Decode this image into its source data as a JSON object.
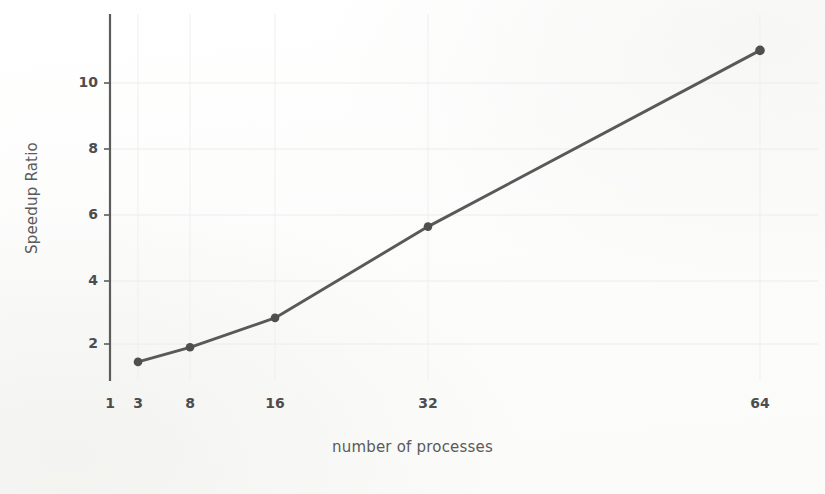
{
  "chart_data": {
    "type": "line",
    "title": "",
    "subtitle": "",
    "xlabel": "number of processes",
    "ylabel": "Speedup Ratio",
    "x": [
      3,
      8,
      16,
      32,
      64
    ],
    "values": [
      1.45,
      1.9,
      2.8,
      5.6,
      11.0
    ],
    "series": [
      {
        "name": "speedup",
        "x": [
          3,
          8,
          16,
          32,
          64
        ],
        "values": [
          1.45,
          1.9,
          2.8,
          5.6,
          11.0
        ]
      }
    ],
    "xtick_labels": [
      "1",
      "3",
      "8",
      "16",
      "32",
      "64"
    ],
    "xtick_values": [
      1,
      3,
      8,
      16,
      32,
      64
    ],
    "ytick_labels": [
      "2",
      "4",
      "6",
      "8",
      "10"
    ],
    "ytick_values": [
      2,
      4,
      6,
      8,
      10
    ],
    "xlim": [
      1,
      67
    ],
    "ylim": [
      0.55,
      11.6
    ],
    "grid": true,
    "legend": false,
    "legend_position": "none",
    "marker": "circle",
    "line_color": "#595959",
    "marker_color": "#4f4f4f",
    "grid_color": "#ebebeb",
    "axis_color": "#5c5c5c",
    "text_color": "#4d4d4d",
    "background": "#fdfdfd"
  },
  "axes": {
    "y_ticks": [
      {
        "label": "2",
        "y": 344
      },
      {
        "label": "4",
        "y": 281
      },
      {
        "label": "6",
        "y": 215
      },
      {
        "label": "8",
        "y": 149
      },
      {
        "label": "10",
        "y": 83
      }
    ],
    "x_ticks": [
      {
        "label": "1",
        "x": 110
      },
      {
        "label": "3",
        "x": 138
      },
      {
        "label": "8",
        "x": 190
      },
      {
        "label": "16",
        "x": 275
      },
      {
        "label": "32",
        "x": 428
      },
      {
        "label": "64",
        "x": 760
      }
    ]
  }
}
